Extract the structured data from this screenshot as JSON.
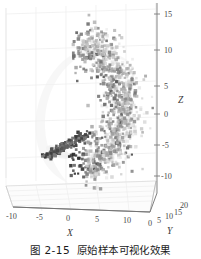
{
  "figure": {
    "caption_number": "图 2-15",
    "caption_text": "原始样本可视化效果"
  },
  "chart_data": {
    "type": "scatter",
    "projection": "3d",
    "title": "",
    "xlabel": "X",
    "ylabel": "Y",
    "zlabel": "Z",
    "xticks": [
      -10,
      -5,
      0,
      5,
      10
    ],
    "yticks": [
      0,
      5,
      10,
      15,
      20
    ],
    "zticks": [
      -10,
      -5,
      0,
      5,
      10,
      15
    ],
    "xlim": [
      -13,
      13
    ],
    "ylim": [
      -1,
      21
    ],
    "zlim": [
      -12,
      16
    ],
    "grid": true,
    "legend": null,
    "marker": "square",
    "colormap": "grayscale",
    "point_count": 1000,
    "shape": "crescent-banana",
    "xtick_labels": [
      "-10",
      "-5",
      "0",
      "5",
      "10"
    ],
    "ytick_labels": [
      "0",
      "5",
      "10",
      "15",
      "20"
    ],
    "ztick_labels": [
      "15",
      "10",
      "5",
      "0",
      "-5",
      "-10"
    ]
  }
}
